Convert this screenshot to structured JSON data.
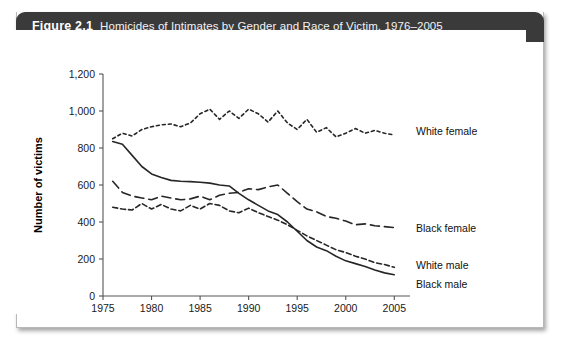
{
  "figure": {
    "label": "Figure 2.1",
    "title": "Homicides of Intimates by Gender and Race of Victim, 1976–2005"
  },
  "chart_data": {
    "type": "line",
    "title": "Homicides of Intimates by Gender and Race of Victim, 1976–2005",
    "xlabel": "",
    "ylabel": "Number of victims",
    "xlim": [
      1975,
      2006
    ],
    "ylim": [
      0,
      1200
    ],
    "yticks": [
      0,
      200,
      400,
      600,
      800,
      1000,
      1200
    ],
    "ytick_labels": [
      "0",
      "200",
      "400",
      "600",
      "800",
      "1,000",
      "1,200"
    ],
    "xticks": [
      1975,
      1980,
      1985,
      1990,
      1995,
      2000,
      2005
    ],
    "xtick_labels": [
      "1975",
      "1980",
      "1985",
      "1990",
      "1995",
      "2000",
      "2005"
    ],
    "grid": false,
    "legend_position": "inline-right",
    "x": [
      1976,
      1977,
      1978,
      1979,
      1980,
      1981,
      1982,
      1983,
      1984,
      1985,
      1986,
      1987,
      1988,
      1989,
      1990,
      1991,
      1992,
      1993,
      1994,
      1995,
      1996,
      1997,
      1998,
      1999,
      2000,
      2001,
      2002,
      2003,
      2004,
      2005
    ],
    "series": [
      {
        "name": "White female",
        "label": "White female",
        "dash": "3,3",
        "values": [
          850,
          880,
          865,
          900,
          915,
          925,
          930,
          915,
          935,
          985,
          1010,
          955,
          1000,
          960,
          1010,
          985,
          940,
          1000,
          935,
          900,
          955,
          885,
          910,
          860,
          880,
          905,
          880,
          895,
          880,
          870
        ]
      },
      {
        "name": "Black female",
        "label": "Black female",
        "dash": "9,5",
        "values": [
          620,
          560,
          540,
          530,
          520,
          540,
          530,
          520,
          525,
          540,
          520,
          545,
          555,
          560,
          580,
          575,
          590,
          600,
          555,
          510,
          470,
          455,
          430,
          420,
          405,
          385,
          390,
          380,
          375,
          370
        ]
      },
      {
        "name": "White male",
        "label": "White male",
        "dash": "5,3",
        "values": [
          480,
          470,
          465,
          500,
          470,
          495,
          470,
          460,
          490,
          470,
          500,
          490,
          460,
          450,
          475,
          450,
          430,
          410,
          385,
          355,
          325,
          300,
          275,
          250,
          235,
          215,
          200,
          180,
          170,
          155
        ]
      },
      {
        "name": "Black male",
        "label": "Black male",
        "dash": "none",
        "values": [
          835,
          820,
          760,
          700,
          660,
          640,
          625,
          620,
          618,
          615,
          610,
          600,
          595,
          555,
          520,
          490,
          460,
          440,
          400,
          350,
          300,
          265,
          245,
          215,
          190,
          175,
          160,
          140,
          125,
          115
        ]
      }
    ]
  }
}
